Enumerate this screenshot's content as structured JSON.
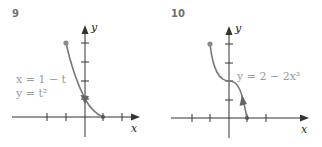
{
  "figures": [
    {
      "number": "9",
      "equation_lines": [
        "x = 1 − t",
        "y = t²"
      ],
      "x_label": "x",
      "y_label": "y",
      "start_point": [
        -1,
        4
      ],
      "end_point": [
        1,
        0
      ]
    },
    {
      "number": "10",
      "equation_lines": [
        "y = 2 − 2x³"
      ],
      "x_label": "x",
      "y_label": "y",
      "start_point": [
        -1,
        4
      ],
      "end_point": [
        1,
        0
      ]
    }
  ],
  "colors": {
    "curve": "#7a7a7a",
    "axis": "#333333",
    "equation": "#9a9a9a"
  }
}
